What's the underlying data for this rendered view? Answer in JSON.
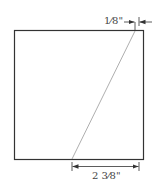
{
  "diagram": {
    "type": "dimensioned square panel with diagonal line",
    "shape": {
      "kind": "square",
      "stroke_color": "#333333"
    },
    "diagonal": {
      "from": "bottom edge",
      "to": "top edge near right corner",
      "color": "#888888"
    },
    "dimensions": {
      "top_offset": {
        "label": "1⁄8\"",
        "description": "offset of diagonal end from right edge at top"
      },
      "bottom_offset": {
        "label": "2 3⁄8\"",
        "description": "distance from diagonal start to right edge at bottom"
      }
    },
    "colors": {
      "line": "#333333",
      "dimension": "#333333",
      "text": "#444444"
    }
  }
}
